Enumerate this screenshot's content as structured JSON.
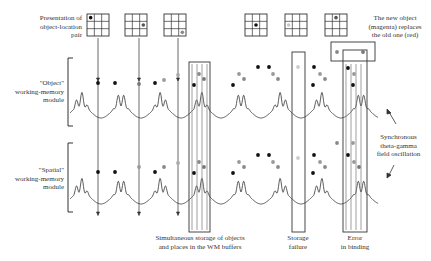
{
  "labels": {
    "presentation": "Presentation of\nobject-location\npair",
    "new_object": "The new object\n(magenta) replaces\nthe old one (red)",
    "object_module": "\"Object\"\nworking-memory\nmodule",
    "spatial_module": "\"Spatial\"\nworking-memory\nmodule",
    "synchronous": "Synchronous\ntheta-gamma\nfield oscillation",
    "simultaneous": "Simultaneous storage of objects\nand places in the WM buffers",
    "storage_failure": "Storage\nfailure",
    "error_binding": "Error\nin binding"
  },
  "colors": {
    "line": "#444444",
    "dot_black": "#111111",
    "dot_gray": "#8a8a8a",
    "dot_light": "#c8c8c8",
    "grid": "#333333"
  },
  "grids": [
    {
      "x": 87,
      "y": 14,
      "dot": [
        0,
        0
      ],
      "shade": "black"
    },
    {
      "x": 125,
      "y": 14,
      "dot": [
        1,
        2
      ],
      "shade": "dark"
    },
    {
      "x": 164,
      "y": 14,
      "dot": [
        2,
        2
      ],
      "shade": "gray"
    },
    {
      "x": 245,
      "y": 14,
      "dot": [
        1,
        1
      ],
      "shade": "black"
    },
    {
      "x": 285,
      "y": 14,
      "dot": [
        1,
        0
      ],
      "shade": "light"
    },
    {
      "x": 325,
      "y": 14,
      "dot": [
        0,
        1
      ],
      "shade": "dark"
    }
  ]
}
